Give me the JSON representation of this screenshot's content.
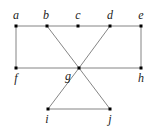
{
  "graph": {
    "nodes": [
      {
        "id": "a",
        "label": "a",
        "x": 16,
        "y": 26,
        "lx": 16,
        "ly": 19,
        "anchor": "middle"
      },
      {
        "id": "b",
        "label": "b",
        "x": 47,
        "y": 26,
        "lx": 46,
        "ly": 19,
        "anchor": "middle"
      },
      {
        "id": "c",
        "label": "c",
        "x": 78,
        "y": 26,
        "lx": 78,
        "ly": 19,
        "anchor": "middle"
      },
      {
        "id": "d",
        "label": "d",
        "x": 110,
        "y": 26,
        "lx": 110,
        "ly": 19,
        "anchor": "middle"
      },
      {
        "id": "e",
        "label": "e",
        "x": 141,
        "y": 26,
        "lx": 141,
        "ly": 19,
        "anchor": "middle"
      },
      {
        "id": "f",
        "label": "f",
        "x": 16,
        "y": 68,
        "lx": 16,
        "ly": 82,
        "anchor": "middle"
      },
      {
        "id": "g",
        "label": "g",
        "x": 79,
        "y": 68,
        "lx": 68,
        "ly": 80,
        "anchor": "middle"
      },
      {
        "id": "h",
        "label": "h",
        "x": 141,
        "y": 68,
        "lx": 141,
        "ly": 82,
        "anchor": "middle"
      },
      {
        "id": "i",
        "label": "i",
        "x": 48,
        "y": 109,
        "lx": 47,
        "ly": 123,
        "anchor": "middle"
      },
      {
        "id": "j",
        "label": "j",
        "x": 110,
        "y": 109,
        "lx": 110,
        "ly": 123,
        "anchor": "middle"
      }
    ],
    "edges": [
      [
        "a",
        "b"
      ],
      [
        "b",
        "c"
      ],
      [
        "c",
        "d"
      ],
      [
        "d",
        "e"
      ],
      [
        "a",
        "f"
      ],
      [
        "e",
        "h"
      ],
      [
        "f",
        "g"
      ],
      [
        "g",
        "h"
      ],
      [
        "b",
        "g"
      ],
      [
        "g",
        "j"
      ],
      [
        "d",
        "g"
      ],
      [
        "g",
        "i"
      ],
      [
        "i",
        "j"
      ]
    ]
  }
}
